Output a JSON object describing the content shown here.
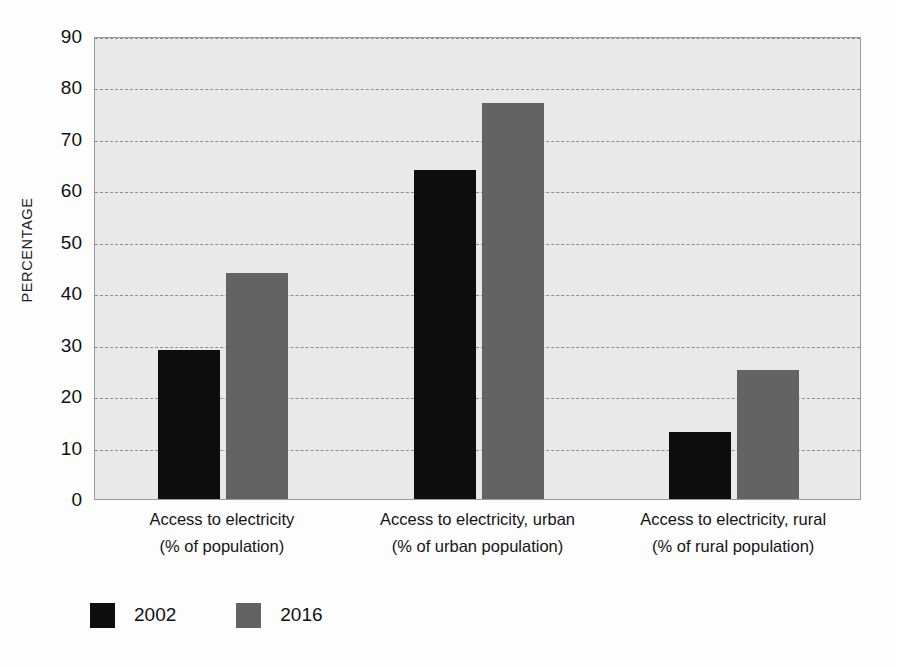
{
  "chart_data": {
    "type": "bar",
    "title": "",
    "subtitle": "",
    "xlabel": "",
    "ylabel": "PERCENTAGE",
    "ylim": [
      0,
      90
    ],
    "ytick_labels": [
      "90",
      "80",
      "70",
      "60",
      "50",
      "40",
      "30",
      "20",
      "10",
      "0"
    ],
    "ytick_values": [
      90,
      80,
      70,
      60,
      50,
      40,
      30,
      20,
      10,
      0
    ],
    "grid": true,
    "grid_axis": "y",
    "legend_position": "bottom-left",
    "categories": [
      "Access to electricity\n(% of population)",
      "Access to electricity, urban\n(% of urban population)",
      "Access to electricity, rural\n(% of rural population)"
    ],
    "category_lines": [
      {
        "line1": "Access to electricity",
        "line2": "(% of population)"
      },
      {
        "line1": "Access to electricity, urban",
        "line2": "(% of urban population)"
      },
      {
        "line1": "Access to electricity, rural",
        "line2": "(% of rural population)"
      }
    ],
    "series": [
      {
        "name": "2002",
        "color": "#0d0d0d",
        "values": [
          29,
          64,
          13
        ]
      },
      {
        "name": "2016",
        "color": "#636363",
        "values": [
          44,
          77,
          25
        ]
      }
    ]
  },
  "legend": {
    "entries": [
      {
        "label": "2002",
        "color": "#0d0d0d"
      },
      {
        "label": "2016",
        "color": "#636363"
      }
    ]
  },
  "colors": {
    "plot_background": "#e9e9e9",
    "plot_border": "#9a9a9a",
    "gridline": "#8d8d8d",
    "page_background": "#fdfdfd",
    "text": "#111111",
    "series_2002": "#0d0d0d",
    "series_2016": "#636363"
  }
}
